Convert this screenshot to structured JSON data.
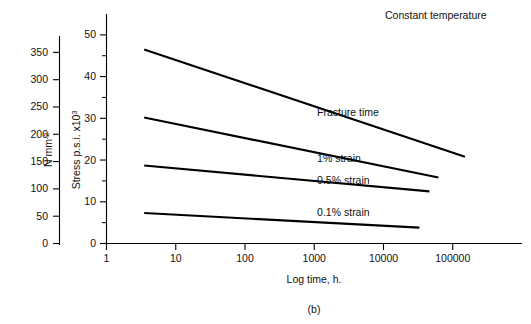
{
  "figure": {
    "panel_label": "(b)",
    "note": "Constant temperature"
  },
  "axes": {
    "x": {
      "label": "Log time, h.",
      "scale": "log",
      "ticks": [
        "1",
        "10",
        "100",
        "1000",
        "10000",
        "100000"
      ],
      "tick_values": [
        1,
        10,
        100,
        1000,
        10000,
        100000
      ],
      "range": [
        1,
        1000000
      ]
    },
    "y_primary": {
      "label_text": "Stress p.s.i. x10",
      "label_sup": "3",
      "ticks": [
        "0",
        "10",
        "20",
        "30",
        "40",
        "50"
      ],
      "tick_values": [
        0,
        10,
        20,
        30,
        40,
        50
      ],
      "minor_step": 5,
      "range": [
        0,
        55
      ]
    },
    "y_secondary": {
      "label_text": "N mm",
      "label_sup": "-2",
      "ticks": [
        "0",
        "50",
        "100",
        "150",
        "200",
        "250",
        "300",
        "350"
      ],
      "tick_values": [
        0,
        50,
        100,
        150,
        200,
        250,
        300,
        350
      ],
      "range": [
        0,
        380
      ]
    }
  },
  "chart_data": {
    "type": "line",
    "title": "Constant temperature",
    "xlabel": "Log time, h.",
    "ylabel": "Stress p.s.i. x10^3",
    "ylabel_secondary": "N mm^-2",
    "xscale": "log",
    "xlim": [
      1,
      1000000
    ],
    "ylim": [
      0,
      55
    ],
    "grid": false,
    "legend": "inline-labels",
    "series": [
      {
        "name": "Fracture time",
        "label": "Fracture time",
        "x": [
          3.5,
          150000
        ],
        "y": [
          46.5,
          20.8
        ],
        "label_x": 1100,
        "label_y": 30.5
      },
      {
        "name": "1% strain",
        "label": "1% strain",
        "x": [
          3.5,
          62000
        ],
        "y": [
          30.2,
          15.8
        ],
        "label_x": 1100,
        "label_y": 19.5
      },
      {
        "name": "0.5% strain",
        "label": "0.5% strain",
        "x": [
          3.5,
          46000
        ],
        "y": [
          18.7,
          12.5
        ],
        "label_x": 1100,
        "label_y": 14.2
      },
      {
        "name": "0.1% strain",
        "label": "0.1% strain",
        "x": [
          3.5,
          33000
        ],
        "y": [
          7.3,
          3.8
        ],
        "label_x": 1100,
        "label_y": 6.7
      }
    ]
  },
  "colors": {
    "background": "#ffffff",
    "ink": "#000000",
    "curve": "#000000"
  }
}
